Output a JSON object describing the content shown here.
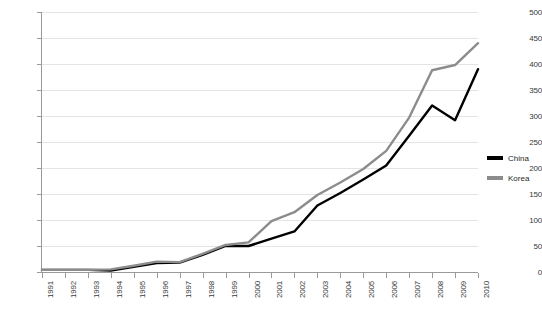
{
  "chart_data": {
    "type": "line",
    "title": "",
    "xlabel": "",
    "ylabel": "",
    "grid": true,
    "legend_position": "right",
    "ylim": [
      0,
      500
    ],
    "ytick_step": 50,
    "yticks": [
      0,
      50,
      100,
      150,
      200,
      250,
      300,
      350,
      400,
      450,
      500
    ],
    "categories": [
      "1991",
      "1992",
      "1993",
      "1994",
      "1995",
      "1996",
      "1997",
      "1998",
      "1999",
      "2000",
      "2001",
      "2002",
      "2003",
      "2004",
      "2005",
      "2006",
      "2007",
      "2008",
      "2009",
      "2010"
    ],
    "x": [
      1991,
      1992,
      1993,
      1994,
      1995,
      1996,
      1997,
      1998,
      1999,
      2000,
      2001,
      2002,
      2003,
      2004,
      2005,
      2006,
      2007,
      2008,
      2009,
      2010
    ],
    "series": [
      {
        "name": "China",
        "color": "#000000",
        "values": [
          4,
          4,
          4,
          3,
          10,
          17,
          18,
          33,
          50,
          50,
          64,
          78,
          128,
          152,
          178,
          205,
          262,
          320,
          292,
          390
        ]
      },
      {
        "name": "Korea",
        "color": "#8c8c8c",
        "values": [
          4,
          4,
          4,
          5,
          12,
          20,
          19,
          35,
          52,
          57,
          98,
          115,
          148,
          172,
          198,
          233,
          297,
          388,
          398,
          440
        ]
      }
    ]
  },
  "legend": {
    "items": [
      {
        "label": "China",
        "color": "#000000"
      },
      {
        "label": "Korea",
        "color": "#8c8c8c"
      }
    ]
  }
}
